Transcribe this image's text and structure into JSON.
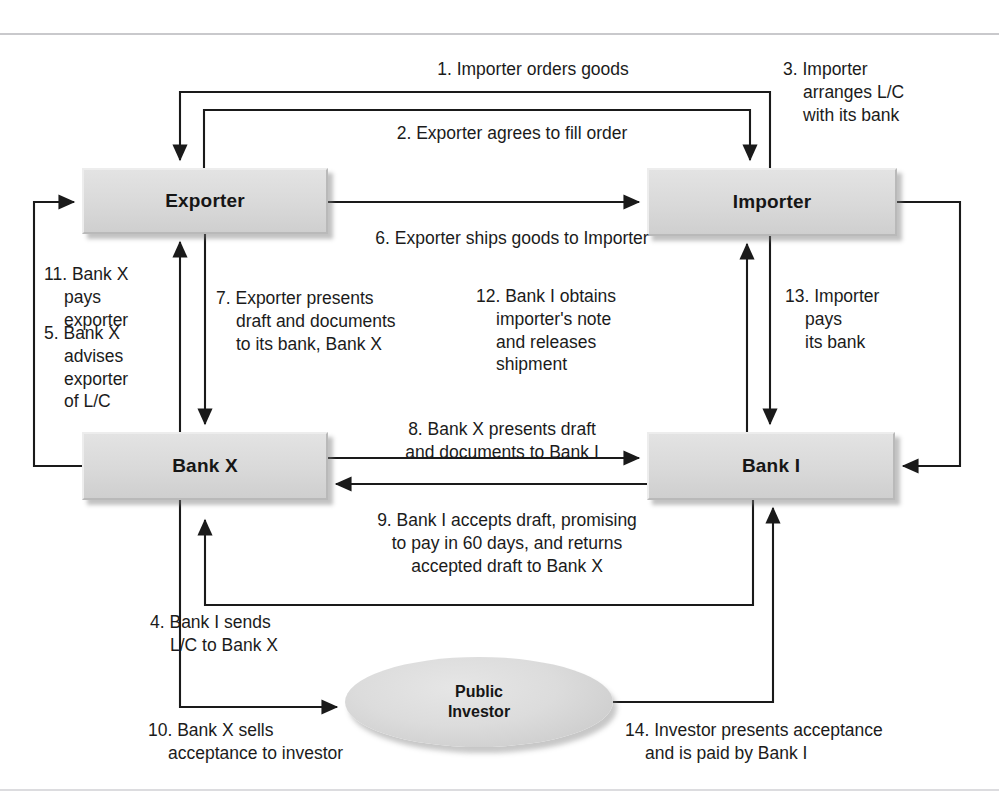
{
  "diagram": {
    "type": "process-flow",
    "colors": {
      "node_fill": "#d9d9d9",
      "node_border": "#b9b9b9",
      "line": "#1a1a1a",
      "rule": "#c9c9cc",
      "text": "#1b1b1b"
    }
  },
  "nodes": {
    "exporter": {
      "label": "Exporter",
      "shape": "rectangle"
    },
    "importer": {
      "label": "Importer",
      "shape": "rectangle"
    },
    "bank_x": {
      "label": "Bank X",
      "shape": "rectangle"
    },
    "bank_i": {
      "label": "Bank I",
      "shape": "rectangle"
    },
    "investor": {
      "label_line1": "Public",
      "label_line2": "Investor",
      "shape": "ellipse"
    }
  },
  "steps": [
    {
      "n": 1,
      "text": "1. Importer orders goods",
      "from": "importer",
      "to": "exporter"
    },
    {
      "n": 2,
      "text": "2. Exporter agrees to fill order",
      "from": "exporter",
      "to": "importer"
    },
    {
      "n": 3,
      "text": "3. Importer\narranges L/C\nwith its bank",
      "from": "importer",
      "to": "bank_i"
    },
    {
      "n": 4,
      "text": "4. Bank I sends\nL/C to Bank X",
      "from": "bank_i",
      "to": "bank_x"
    },
    {
      "n": 5,
      "text": "5. Bank X\nadvises\nexporter\nof L/C",
      "from": "bank_x",
      "to": "exporter"
    },
    {
      "n": 6,
      "text": "6. Exporter ships goods to Importer",
      "from": "exporter",
      "to": "importer"
    },
    {
      "n": 7,
      "text": "7. Exporter presents\ndraft and documents\nto its bank, Bank X",
      "from": "exporter",
      "to": "bank_x"
    },
    {
      "n": 8,
      "text": "8. Bank X presents draft\nand documents to Bank I",
      "from": "bank_x",
      "to": "bank_i"
    },
    {
      "n": 9,
      "text": "9. Bank I accepts draft, promising\nto pay in 60 days, and returns\naccepted draft to Bank X",
      "from": "bank_i",
      "to": "bank_x"
    },
    {
      "n": 10,
      "text": "10. Bank  X sells\nacceptance to investor",
      "from": "bank_x",
      "to": "investor"
    },
    {
      "n": 11,
      "text": "11. Bank X\npays\nexporter",
      "from": "bank_x",
      "to": "exporter"
    },
    {
      "n": 12,
      "text": "12. Bank I obtains\nimporter's note\nand releases\nshipment",
      "from": "bank_i",
      "to": "importer"
    },
    {
      "n": 13,
      "text": "13. Importer\npays\nits bank",
      "from": "importer",
      "to": "bank_i"
    },
    {
      "n": 14,
      "text": "14. Investor presents acceptance\nand is paid by Bank I",
      "from": "investor",
      "to": "bank_i"
    }
  ]
}
